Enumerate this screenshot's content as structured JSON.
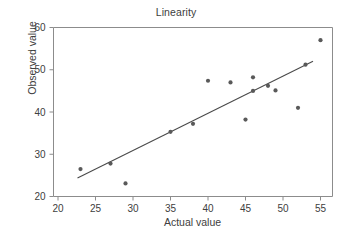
{
  "chart_data": {
    "type": "scatter",
    "title": "Linearity",
    "xlabel": "Actual value",
    "ylabel": "Observed value",
    "xlim": [
      19.4,
      56.6
    ],
    "ylim": [
      20,
      60
    ],
    "xticks": [
      20,
      25,
      30,
      35,
      40,
      45,
      50,
      55
    ],
    "yticks": [
      20,
      30,
      40,
      50,
      60
    ],
    "grid": false,
    "legend": null,
    "point_color": "#595959",
    "line_color": "#4a4a4a",
    "axis_color": "#8c8c8c",
    "points": [
      {
        "x": 23,
        "y": 26.5
      },
      {
        "x": 27,
        "y": 27.8
      },
      {
        "x": 29,
        "y": 23.1
      },
      {
        "x": 35,
        "y": 35.3
      },
      {
        "x": 38,
        "y": 37.2
      },
      {
        "x": 40,
        "y": 47.4
      },
      {
        "x": 43,
        "y": 47.0
      },
      {
        "x": 45,
        "y": 38.2
      },
      {
        "x": 46,
        "y": 45.0
      },
      {
        "x": 46,
        "y": 48.2
      },
      {
        "x": 48,
        "y": 46.2
      },
      {
        "x": 49,
        "y": 45.1
      },
      {
        "x": 52,
        "y": 41.0
      },
      {
        "x": 53,
        "y": 51.2
      },
      {
        "x": 55,
        "y": 57.0
      }
    ],
    "fit_line": {
      "x_start": 22.6,
      "y_start": 24.4,
      "x_end": 54.0,
      "y_end": 52.0
    }
  }
}
